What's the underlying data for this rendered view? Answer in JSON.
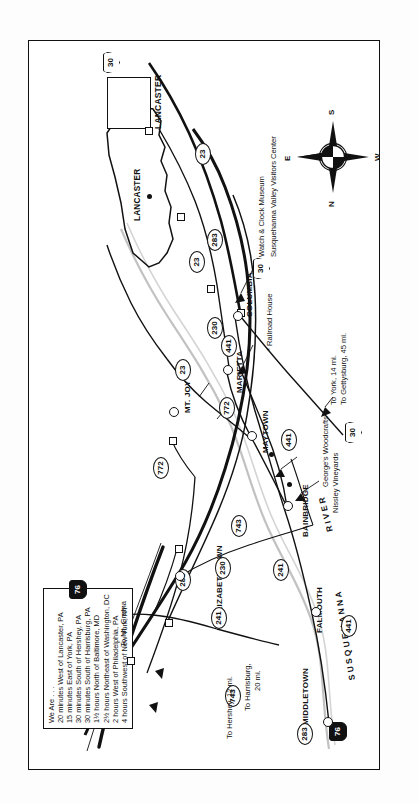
{
  "document": {
    "type": "road-map",
    "title": "Lancaster County Area Road Map",
    "orientation": "landscape map rotated 90 degrees counter-clockwise within a portrait frame"
  },
  "info_box": {
    "heading": "We Are . . .",
    "lines": [
      "20 minutes West of Lancaster, PA",
      "15 minutes East of York, PA",
      "30 minutes South of Hershey, PA",
      "30 minutes South of Harrisburg, PA",
      "1½ hours North of Baltimore, MD",
      "2½ hours Northeast of Washington, DC",
      "2 hours West of Philadelphia, PA",
      "4 hours Southwest of New York, NY"
    ]
  },
  "county_inset": {
    "label": "LANCASTER"
  },
  "city_box": {
    "label": "LANCASTER"
  },
  "cities": [
    {
      "name": "MIDDLETOWN"
    },
    {
      "name": "ELIZABETHTOWN"
    },
    {
      "name": "FALMOUTH"
    },
    {
      "name": "BAINBRIDGE"
    },
    {
      "name": "MAYTOWN"
    },
    {
      "name": "MARIETTA"
    },
    {
      "name": "MT. JOY"
    },
    {
      "name": "COLUMBIA"
    }
  ],
  "river": {
    "label": "SUSQUEHANNA",
    "label2": "RIVER"
  },
  "route_shields": [
    {
      "number": "283",
      "kind": "state"
    },
    {
      "number": "283",
      "kind": "state"
    },
    {
      "number": "283",
      "kind": "state"
    },
    {
      "number": "230",
      "kind": "state"
    },
    {
      "number": "230",
      "kind": "state"
    },
    {
      "number": "241",
      "kind": "state"
    },
    {
      "number": "241",
      "kind": "state"
    },
    {
      "number": "743",
      "kind": "state"
    },
    {
      "number": "743",
      "kind": "state"
    },
    {
      "number": "772",
      "kind": "state"
    },
    {
      "number": "772",
      "kind": "state"
    },
    {
      "number": "441",
      "kind": "state"
    },
    {
      "number": "441",
      "kind": "state"
    },
    {
      "number": "441",
      "kind": "state"
    },
    {
      "number": "23",
      "kind": "state"
    },
    {
      "number": "23",
      "kind": "state"
    },
    {
      "number": "23",
      "kind": "state"
    },
    {
      "number": "30",
      "kind": "us"
    },
    {
      "number": "30",
      "kind": "us"
    },
    {
      "number": "30",
      "kind": "us"
    },
    {
      "number": "76",
      "kind": "interstate"
    },
    {
      "number": "76",
      "kind": "interstate"
    }
  ],
  "shield_numbers": {
    "s283_top": "283",
    "s283_mid": "283",
    "s283_left": "283",
    "s230_top": "230",
    "s230_mid": "230",
    "s241_up": "241",
    "s241_low": "241",
    "s743_left": "743",
    "s743_mid": "743",
    "s772_up": "772",
    "s772_low": "772",
    "s441_falmouth": "441",
    "s441_bainbridge": "441",
    "s441_marietta": "441",
    "s23_lanc": "23",
    "s23_mid": "23",
    "s23_low": "23",
    "s30_top": "30",
    "s30_col": "30",
    "s30_york": "30",
    "i76_top": "76",
    "i76_bot": "76"
  },
  "direction_labels": [
    "To Hershey, 12 mi.",
    "To Harrisburg, 20 mi.",
    "To Mt. Gretna",
    "To York, 14 mi.",
    "To Gettysburg, 45 mi."
  ],
  "direction_text": {
    "hershey": "To Hershey, 12 mi.",
    "harrisburg_1": "To Harrisburg,",
    "harrisburg_2": "20 mi.",
    "gretna": "To Mt. Gretna",
    "york": "To York, 14 mi.",
    "gettysburg": "To Gettysburg, 45 mi."
  },
  "points_of_interest": [
    {
      "label": "Nissley Vineyards"
    },
    {
      "label": "George's Woodcrafts"
    },
    {
      "label": "Railroad House",
      "prefix": "*"
    },
    {
      "label": "Watch & Clock Museum"
    },
    {
      "label": "Susquehanna Valley Visitors Center"
    }
  ],
  "poi_text": {
    "nissley": "Nissley Vineyards",
    "george": "George's Woodcrafts",
    "railroad": "* Railroad House",
    "watch_clock": "Watch & Clock Museum",
    "visitors": "Susquehanna Valley Visitors Center"
  },
  "compass": {
    "n": "N",
    "e": "E",
    "s": "S",
    "w": "W"
  },
  "colors": {
    "ink": "#111111",
    "paper": "#ffffff",
    "river": "#b9b9b9"
  }
}
